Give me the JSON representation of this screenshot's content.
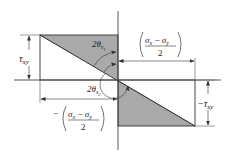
{
  "diagram": {
    "type": "stress-transformation-geometry",
    "colors": {
      "line": "#333333",
      "shade": "#a9a9a9",
      "background": "#ffffff"
    },
    "labels": {
      "tau_xy": "τ",
      "tau_xy_sub": "xy",
      "neg_tau_xy_sign": "−",
      "neg_tau_xy": "τ",
      "neg_tau_xy_sub": "xy",
      "theta1_coeff": "2θ",
      "theta1_sub": "s",
      "theta1_subsub": "1",
      "theta2_coeff": "2θ",
      "theta2_sub": "s",
      "theta2_subsub": "2",
      "frac_top_num": "σ",
      "frac_top_num_sub1": "x",
      "frac_top_minus": " − ",
      "frac_top_num2": "σ",
      "frac_top_num_sub2": "y",
      "frac_top_den": "2",
      "frac_bot_sign": "−",
      "frac_bot_num": "σ",
      "frac_bot_num_sub1": "x",
      "frac_bot_minus": " − ",
      "frac_bot_num2": "σ",
      "frac_bot_num_sub2": "y",
      "frac_bot_den": "2"
    }
  }
}
